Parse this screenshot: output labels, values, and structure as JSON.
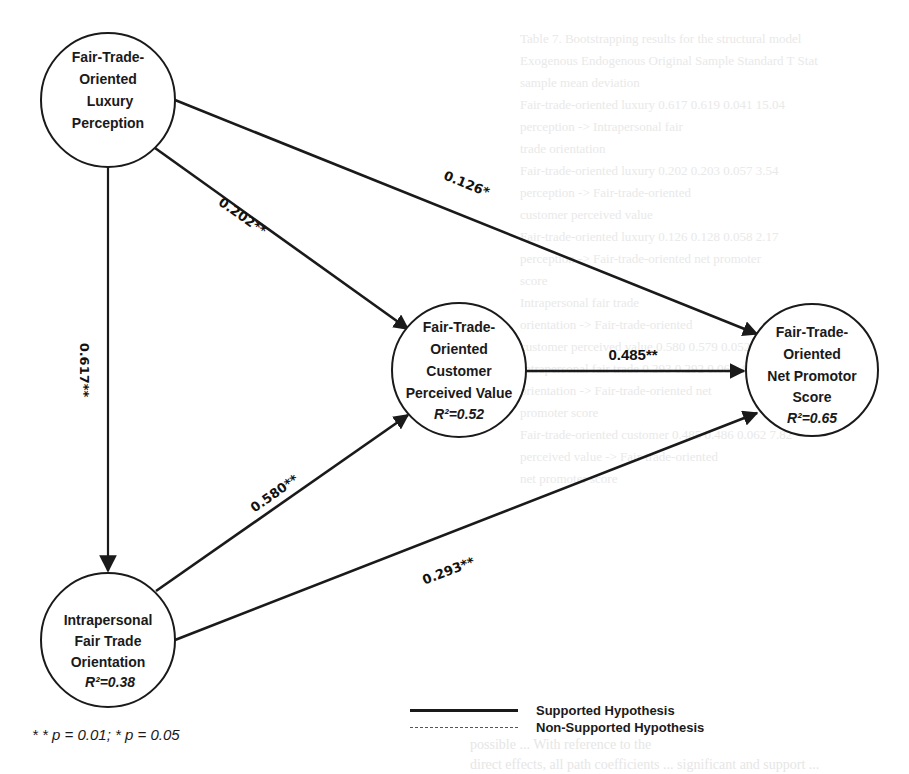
{
  "background_bleed": {
    "lines": [
      "Table 7. Bootstrapping results for the structural model",
      "Exogenous        Endogenous         Original    Sample    Standard    T Stat",
      "                                    sample      mean      deviation",
      "Fair-trade-oriented luxury          0.617       0.619     0.041       15.04",
      "perception -> Intrapersonal fair",
      "trade orientation",
      "Fair-trade-oriented luxury          0.202       0.203     0.057       3.54",
      "perception -> Fair-trade-oriented",
      "customer perceived value",
      "Fair-trade-oriented luxury          0.126       0.128     0.058       2.17",
      "perception -> Fair-trade-oriented net promoter",
      "score",
      "Intrapersonal fair trade                                                ",
      "orientation -> Fair-trade-oriented",
      "customer perceived value            0.580       0.579     0.052       11.15",
      "Intrapersonal fair trade            0.293       0.292     0.068       4.31",
      "orientation -> Fair-trade-oriented net",
      "promoter score",
      "Fair-trade-oriented customer        0.485       0.486     0.062       7.82",
      "perceived value -> Fair-trade-oriented",
      "net promoter score"
    ],
    "bottom_lines": [
      "possible ... With reference to the",
      "direct effects, all path coefficients ... significant and support ..."
    ]
  },
  "nodes": [
    {
      "id": "luxury",
      "lines": [
        "Fair-Trade-",
        "Oriented",
        "Luxury",
        "Perception"
      ],
      "r2": "",
      "cx": 108,
      "cy": 100,
      "r": 67
    },
    {
      "id": "cpv",
      "lines": [
        "Fair-Trade-",
        "Oriented",
        "Customer",
        "Perceived Value"
      ],
      "r2": "R²=0.52",
      "cx": 459,
      "cy": 370,
      "r": 67
    },
    {
      "id": "nps",
      "lines": [
        "Fair-Trade-",
        "Oriented",
        "Net Promotor",
        "Score"
      ],
      "r2": "R²=0.65",
      "cx": 812,
      "cy": 370,
      "r": 66
    },
    {
      "id": "intrapersonal",
      "lines": [
        "Intrapersonal",
        "Fair Trade",
        "Orientation"
      ],
      "r2": "R²=0.38",
      "cx": 108,
      "cy": 640,
      "r": 67
    }
  ],
  "paths": [
    {
      "from": "luxury",
      "to": "intrapersonal",
      "coefficient": "0.617**",
      "significance": "p=0.01",
      "supported": true
    },
    {
      "from": "luxury",
      "to": "cpv",
      "coefficient": "0.202**",
      "significance": "p=0.01",
      "supported": true
    },
    {
      "from": "luxury",
      "to": "nps",
      "coefficient": "0.126*",
      "significance": "p=0.05",
      "supported": true
    },
    {
      "from": "intrapersonal",
      "to": "cpv",
      "coefficient": "0.580**",
      "significance": "p=0.01",
      "supported": true
    },
    {
      "from": "intrapersonal",
      "to": "nps",
      "coefficient": "0.293**",
      "significance": "p=0.01",
      "supported": true
    },
    {
      "from": "cpv",
      "to": "nps",
      "coefficient": "0.485**",
      "significance": "p=0.01",
      "supported": true
    }
  ],
  "footnote": "* *  p = 0.01; * p = 0.05",
  "legend": {
    "supported": "Supported Hypothesis",
    "non_supported": "Non-Supported Hypothesis"
  },
  "colors": {
    "line": "#1a1a1a",
    "background": "#ffffff",
    "bleed": "#e9e9e9"
  }
}
